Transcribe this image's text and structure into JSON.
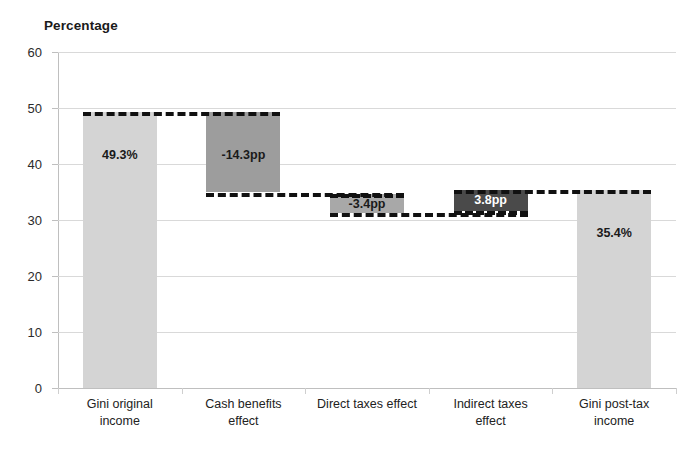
{
  "chart_data": {
    "type": "bar",
    "subtype": "waterfall",
    "title": "",
    "ylabel": "Percentage",
    "xlabel": "",
    "ylim": [
      0,
      60
    ],
    "ytick_step": 10,
    "yticks": [
      "60",
      "50",
      "40",
      "30",
      "20",
      "10",
      "0"
    ],
    "grid": true,
    "legend": "none",
    "categories": [
      "Gini original income",
      "Cash benefits effect",
      "Direct taxes  effect",
      "Indirect taxes effect",
      "Gini post-tax income"
    ],
    "bars": [
      {
        "name": "gini-original-income",
        "label": "49.3%",
        "kind": "total",
        "base": 0,
        "top": 49.3,
        "value": 49.3,
        "color": "#d4d4d4",
        "label_color": "#1a1a1a"
      },
      {
        "name": "cash-benefits-effect",
        "label": "-14.3pp",
        "kind": "decrease",
        "base": 35.0,
        "top": 49.3,
        "value": -14.3,
        "color": "#9d9d9d",
        "label_color": "#1a1a1a"
      },
      {
        "name": "direct-taxes-effect",
        "label": "-3.4pp",
        "kind": "decrease",
        "base": 31.2,
        "top": 34.6,
        "value": -3.4,
        "color": "#a8a8a8",
        "label_color": "#1a1a1a"
      },
      {
        "name": "indirect-taxes-effect",
        "label": "3.8pp",
        "kind": "increase",
        "base": 31.6,
        "top": 35.4,
        "value": 3.8,
        "color": "#4a4a4a",
        "label_color": "#ffffff"
      },
      {
        "name": "gini-post-tax-income",
        "label": "35.4%",
        "kind": "total",
        "base": 0,
        "top": 35.4,
        "value": 35.4,
        "color": "#d4d4d4",
        "label_color": "#1a1a1a"
      }
    ],
    "connectors": [
      {
        "name": "connector-49-3",
        "y": 49.3,
        "from_bar": 0,
        "to_bar": 1
      },
      {
        "name": "connector-35-0",
        "y": 34.9,
        "from_bar": 1,
        "to_bar": 2
      },
      {
        "name": "connector-31-3",
        "y": 31.3,
        "from_bar": 2,
        "to_bar": 3
      },
      {
        "name": "connector-35-4",
        "y": 35.4,
        "from_bar": 3,
        "to_bar": 4
      }
    ],
    "colors": {
      "gridline": "#d9d9d9",
      "axis": "#bfbfbf",
      "connector": "#111111",
      "text": "#222222",
      "background": "#ffffff"
    }
  },
  "axis": {
    "ylabel": "Percentage"
  }
}
